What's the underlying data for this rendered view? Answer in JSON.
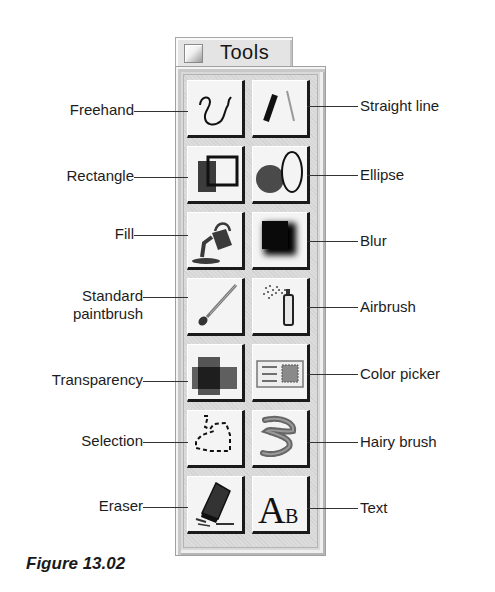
{
  "palette": {
    "title": "Tools",
    "title_icon": "palette-window-icon"
  },
  "tools": [
    {
      "id": "freehand",
      "label": "Freehand",
      "side": "left",
      "col": 0,
      "row": 0,
      "icon": "freehand-icon"
    },
    {
      "id": "straight-line",
      "label": "Straight line",
      "side": "right",
      "col": 1,
      "row": 0,
      "icon": "straight-line-icon"
    },
    {
      "id": "rectangle",
      "label": "Rectangle",
      "side": "left",
      "col": 0,
      "row": 1,
      "icon": "rectangle-icon"
    },
    {
      "id": "ellipse",
      "label": "Ellipse",
      "side": "right",
      "col": 1,
      "row": 1,
      "icon": "ellipse-icon"
    },
    {
      "id": "fill",
      "label": "Fill",
      "side": "left",
      "col": 0,
      "row": 2,
      "icon": "paint-bucket-icon"
    },
    {
      "id": "blur",
      "label": "Blur",
      "side": "right",
      "col": 1,
      "row": 2,
      "icon": "blur-icon"
    },
    {
      "id": "standard-paintbrush",
      "label": "Standard paintbrush",
      "label_lines": [
        "Standard",
        "paintbrush"
      ],
      "side": "left",
      "col": 0,
      "row": 3,
      "icon": "paintbrush-icon"
    },
    {
      "id": "airbrush",
      "label": "Airbrush",
      "side": "right",
      "col": 1,
      "row": 3,
      "icon": "airbrush-icon"
    },
    {
      "id": "transparency",
      "label": "Transparency",
      "side": "left",
      "col": 0,
      "row": 4,
      "icon": "transparency-icon"
    },
    {
      "id": "color-picker",
      "label": "Color picker",
      "side": "right",
      "col": 1,
      "row": 4,
      "icon": "color-picker-icon"
    },
    {
      "id": "selection",
      "label": "Selection",
      "side": "left",
      "col": 0,
      "row": 5,
      "icon": "lasso-selection-icon"
    },
    {
      "id": "hairy-brush",
      "label": "Hairy brush",
      "side": "right",
      "col": 1,
      "row": 5,
      "icon": "hairy-brush-icon"
    },
    {
      "id": "eraser",
      "label": "Eraser",
      "side": "left",
      "col": 0,
      "row": 6,
      "icon": "eraser-icon"
    },
    {
      "id": "text",
      "label": "Text",
      "side": "right",
      "col": 1,
      "row": 6,
      "icon": "text-icon",
      "glyph_big": "A",
      "glyph_small": "B"
    }
  ],
  "caption": "Figure 13.02"
}
